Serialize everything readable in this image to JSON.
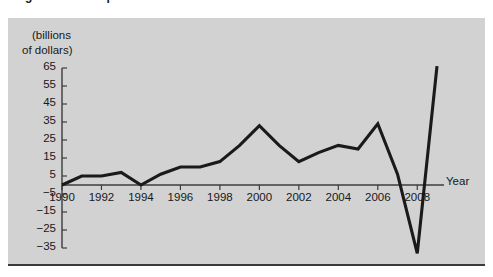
{
  "figure": {
    "cut_off_title": "Figure 3. Net capital flows",
    "unit_caption_line1": "(billions",
    "unit_caption_line2": "of dollars)",
    "xaxis_title": "Year",
    "line_color": "#1a1a1a",
    "axis_color": "#3c3c3c",
    "panel_background": "#d2d2d2"
  },
  "chart_data": {
    "type": "line",
    "title": "",
    "xlabel": "Year",
    "ylabel": "(billions of dollars)",
    "xlim": [
      1990,
      2009
    ],
    "ylim": [
      -35,
      65
    ],
    "grid": false,
    "legend": "none",
    "y_ticks": [
      65,
      55,
      45,
      35,
      25,
      15,
      5,
      -5,
      -15,
      -25,
      -35
    ],
    "y_tick_labels": [
      "65",
      "55",
      "45",
      "35",
      "25",
      "15",
      "5",
      "−5",
      "−15",
      "−25",
      "−35"
    ],
    "x_ticks": [
      1990,
      1992,
      1994,
      1996,
      1998,
      2000,
      2002,
      2004,
      2006,
      2008
    ],
    "x_tick_labels": [
      "1990",
      "1992",
      "1994",
      "1996",
      "1998",
      "2000",
      "2002",
      "2004",
      "2006",
      "2008"
    ],
    "x": [
      1990,
      1991,
      1992,
      1993,
      1994,
      1995,
      1996,
      1997,
      1998,
      1999,
      2000,
      2001,
      2002,
      2003,
      2004,
      2005,
      2006,
      2007,
      2008,
      2009
    ],
    "values": [
      0,
      5,
      5,
      7,
      0,
      6,
      10,
      10,
      13,
      22,
      33,
      22,
      13,
      18,
      22,
      20,
      34,
      6,
      -38,
      66
    ],
    "series": [
      {
        "name": "Net capital flows",
        "values": [
          0,
          5,
          5,
          7,
          0,
          6,
          10,
          10,
          13,
          22,
          33,
          22,
          13,
          18,
          22,
          20,
          34,
          6,
          -38,
          66
        ]
      }
    ],
    "annotations": []
  }
}
